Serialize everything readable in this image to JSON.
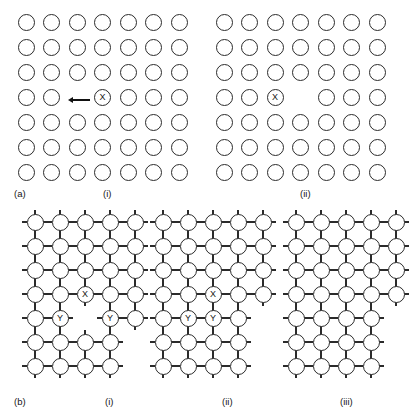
{
  "figure": {
    "background": "#ffffff",
    "ink": "#2b2b2b",
    "rows": [
      {
        "row_label": "(a)",
        "row_label_pos": {
          "x": 14,
          "y": 188
        },
        "lattice_type": "plain-circles",
        "panels": [
          {
            "id": "a-i",
            "caption": "(i)",
            "caption_pos": {
              "x": 103,
              "y": 188
            },
            "origin": {
              "x": 26,
              "y": 22
            },
            "cols": 7,
            "rows": 7,
            "spacing_x": 25.5,
            "spacing_y": 25.0,
            "diameter": 17,
            "vacancies": [
              {
                "row": 4,
                "col": 3
              }
            ],
            "markers": [
              {
                "row": 4,
                "col": 4,
                "label": "X"
              }
            ],
            "arrow": {
              "present": true,
              "direction": "left",
              "label": "hop-arrow",
              "x": 73,
              "y": 100,
              "length": 17
            }
          },
          {
            "id": "a-ii",
            "caption": "(ii)",
            "caption_pos": {
              "x": 300,
              "y": 188
            },
            "origin": {
              "x": 224,
              "y": 22
            },
            "cols": 7,
            "rows": 7,
            "spacing_x": 25.5,
            "spacing_y": 25.0,
            "diameter": 17,
            "vacancies": [
              {
                "row": 4,
                "col": 4
              }
            ],
            "markers": [
              {
                "row": 4,
                "col": 3,
                "label": "X"
              }
            ],
            "arrow": {
              "present": false
            }
          }
        ]
      },
      {
        "row_label": "(b)",
        "row_label_pos": {
          "x": 14,
          "y": 396
        },
        "lattice_type": "bonded-circles",
        "panels": [
          {
            "id": "b-i",
            "caption": "(i)",
            "caption_pos": {
              "x": 105,
              "y": 396
            },
            "origin": {
              "x": 35,
              "y": 222
            },
            "cols": 5,
            "rows": 7,
            "spacing_x": 25.0,
            "spacing_y": 24.0,
            "diameter": 17,
            "vacancies": [
              {
                "row": 5,
                "col": 3
              },
              {
                "row": 6,
                "col": 5
              },
              {
                "row": 7,
                "col": 5
              }
            ],
            "markers": [
              {
                "row": 4,
                "col": 3,
                "label": "X"
              },
              {
                "row": 5,
                "col": 2,
                "label": "Y"
              },
              {
                "row": 5,
                "col": 4,
                "label": "Y"
              }
            ],
            "arrow": {
              "present": false
            }
          },
          {
            "id": "b-ii",
            "caption": "(ii)",
            "caption_pos": {
              "x": 222,
              "y": 396
            },
            "origin": {
              "x": 163,
              "y": 222
            },
            "cols": 5,
            "rows": 7,
            "spacing_x": 25.0,
            "spacing_y": 24.0,
            "diameter": 17,
            "vacancies": [
              {
                "row": 5,
                "col": 5
              },
              {
                "row": 6,
                "col": 5
              },
              {
                "row": 7,
                "col": 5
              }
            ],
            "markers": [
              {
                "row": 4,
                "col": 3,
                "label": "X"
              },
              {
                "row": 5,
                "col": 2,
                "label": "Y"
              },
              {
                "row": 5,
                "col": 3,
                "label": "Y"
              }
            ],
            "arrow": {
              "present": false
            }
          },
          {
            "id": "b-iii",
            "caption": "(iii)",
            "caption_pos": {
              "x": 340,
              "y": 396
            },
            "origin": {
              "x": 296,
              "y": 222
            },
            "cols": 5,
            "rows": 7,
            "spacing_x": 25.0,
            "spacing_y": 24.0,
            "diameter": 17,
            "vacancies": [
              {
                "row": 5,
                "col": 5
              },
              {
                "row": 6,
                "col": 5
              },
              {
                "row": 7,
                "col": 5
              }
            ],
            "markers": [],
            "arrow": {
              "present": false
            }
          }
        ]
      }
    ]
  }
}
